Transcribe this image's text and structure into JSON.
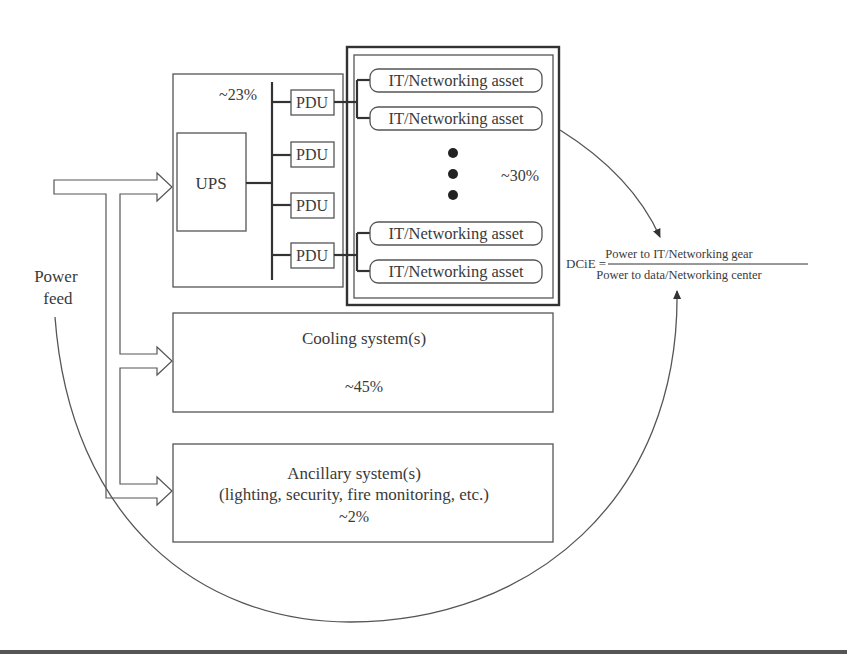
{
  "diagram": {
    "power_feed": {
      "line1": "Power",
      "line2": "feed"
    },
    "ups_section": {
      "percent": "~23%",
      "ups_label": "UPS",
      "pdus": [
        "PDU",
        "PDU",
        "PDU",
        "PDU"
      ]
    },
    "it_section": {
      "percent": "~30%",
      "assets": [
        "IT/Networking asset",
        "IT/Networking asset",
        "IT/Networking asset",
        "IT/Networking asset"
      ]
    },
    "cooling": {
      "title": "Cooling system(s)",
      "percent": "~45%"
    },
    "ancillary": {
      "title": "Ancillary system(s)",
      "subtitle": "(lighting, security, fire monitoring, etc.)",
      "percent": "~2%"
    },
    "formula": {
      "lhs": "DCiE =",
      "numerator": "Power to IT/Networking gear",
      "denominator": "Power to data/Networking center"
    }
  }
}
